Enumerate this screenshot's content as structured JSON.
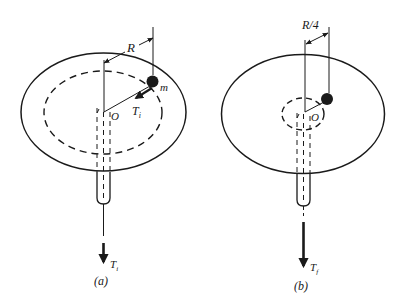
{
  "figure": {
    "panels": [
      {
        "id": "a",
        "caption": "(a)",
        "radius_label": "R",
        "mass_label": "m",
        "center_label": "O",
        "tension_on_mass_label": "T",
        "tension_on_mass_subscript": "i",
        "pull_label": "T",
        "pull_subscript": "i"
      },
      {
        "id": "b",
        "caption": "(b)",
        "radius_label": "R/4",
        "center_label": "O",
        "pull_label": "T",
        "pull_subscript": "f"
      }
    ],
    "colors": {
      "ink": "#1a1a1a",
      "background": "#ffffff"
    }
  }
}
